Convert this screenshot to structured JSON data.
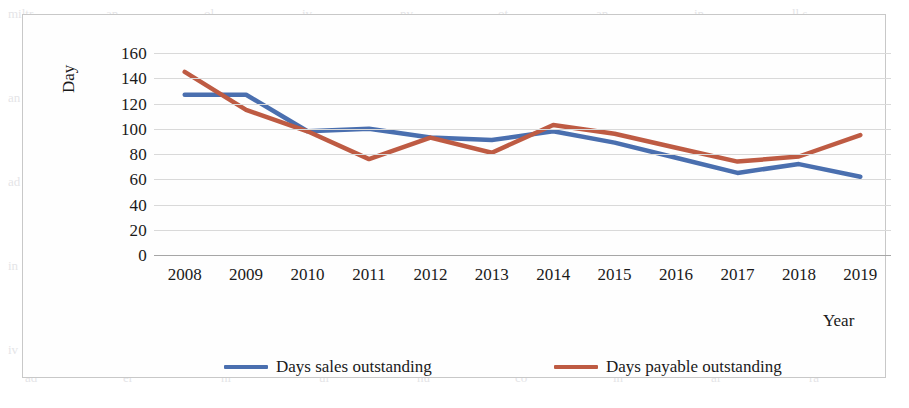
{
  "chart_data": {
    "type": "line",
    "title": "",
    "xlabel": "Year",
    "ylabel": "Day",
    "categories": [
      "2008",
      "2009",
      "2010",
      "2011",
      "2012",
      "2013",
      "2014",
      "2015",
      "2016",
      "2017",
      "2018",
      "2019"
    ],
    "series": [
      {
        "name": "Days sales outstanding",
        "color": "#4A6FAF",
        "values": [
          127,
          127,
          98,
          100,
          93,
          91,
          98,
          89,
          77,
          65,
          72,
          62
        ]
      },
      {
        "name": "Days payable outstanding",
        "color": "#BE5B43",
        "values": [
          145,
          115,
          98,
          76,
          93,
          81,
          103,
          96,
          85,
          74,
          78,
          95
        ]
      }
    ],
    "ylim": [
      0,
      160
    ],
    "ytick_step": 20,
    "yticks": [
      "160",
      "140",
      "120",
      "100",
      "80",
      "60",
      "40",
      "20",
      "0"
    ],
    "grid": true,
    "legend_position": "bottom"
  },
  "axes": {
    "y_title": "Day",
    "x_title": "Year"
  },
  "legend": {
    "items": [
      {
        "label": "Days sales outstanding",
        "color": "#4A6FAF"
      },
      {
        "label": "Days payable outstanding",
        "color": "#BE5B43"
      }
    ]
  },
  "bleed_text": [
    "miltr",
    "an",
    "ol",
    "iv",
    "nv",
    "ot",
    "an",
    "in",
    "ll s",
    "ti",
    "te",
    "on",
    "ad",
    "er",
    "ni",
    "ul",
    "hu",
    "co",
    "in",
    "al",
    "ra"
  ]
}
